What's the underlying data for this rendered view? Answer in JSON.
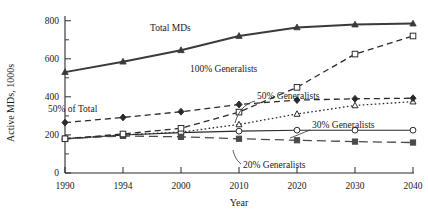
{
  "chart_data": {
    "type": "line",
    "title": "",
    "xlabel": "Year",
    "ylabel": "Active MDs, 1000s",
    "categories": [
      "1990",
      "1994",
      "2000",
      "2010",
      "2020",
      "2030",
      "2040"
    ],
    "ylim": [
      0,
      800
    ],
    "ytick_labels": [
      "0",
      "200",
      "400",
      "600",
      "800"
    ],
    "ytick_values": [
      0,
      200,
      400,
      600,
      800
    ],
    "yminor_values": [
      100,
      300,
      500,
      700
    ],
    "grid": false,
    "legend_position": "inline-annotations",
    "series": [
      {
        "name": "Total MDs",
        "values": [
          530,
          585,
          645,
          720,
          765,
          780,
          785
        ],
        "style": "solid",
        "marker": "triangle-up-filled",
        "annotation": "Total MDs"
      },
      {
        "name": "100% Generalists",
        "values": [
          180,
          205,
          235,
          320,
          450,
          625,
          720
        ],
        "style": "dashed",
        "marker": "square-open",
        "annotation": "100% Generalists"
      },
      {
        "name": "50% of Total",
        "values": [
          265,
          292,
          322,
          360,
          383,
          390,
          393
        ],
        "style": "dashed",
        "marker": "diamond-filled",
        "annotation": "50% of Total"
      },
      {
        "name": "50% Generalists",
        "values": [
          265,
          292,
          322,
          360,
          383,
          390,
          393
        ],
        "style": "dashed",
        "marker": "diamond-filled",
        "annotation": "50% Generalists"
      },
      {
        "name": "30% Generalists",
        "values": [
          180,
          200,
          215,
          255,
          310,
          355,
          375
        ],
        "style": "dotted",
        "marker": "triangle-up-open",
        "annotation": "30% Generalists"
      },
      {
        "name": "Lower solid",
        "values": [
          180,
          200,
          212,
          220,
          225,
          225,
          225
        ],
        "style": "solid-thin",
        "marker": "circle-open",
        "annotation": ""
      },
      {
        "name": "20% Generalists",
        "values": [
          180,
          195,
          190,
          180,
          172,
          165,
          160
        ],
        "style": "long-dash",
        "marker": "square-filled",
        "annotation": "20% Generalists"
      }
    ],
    "annotations": [
      {
        "text": "Total MDs",
        "id": "total-mds"
      },
      {
        "text": "100% Generalists",
        "id": "pct100-generalists"
      },
      {
        "text": "50% of Total",
        "id": "pct50-of-total"
      },
      {
        "text": "50% Generalists",
        "id": "pct50-generalists"
      },
      {
        "text": "30% Generalists",
        "id": "pct30-generalists"
      },
      {
        "text": "20% Generalists",
        "id": "pct20-generalists"
      }
    ],
    "colors": {
      "ink": "#2b2b2b",
      "total_mds": "#3a3a3a",
      "background": "#ffffff"
    }
  }
}
